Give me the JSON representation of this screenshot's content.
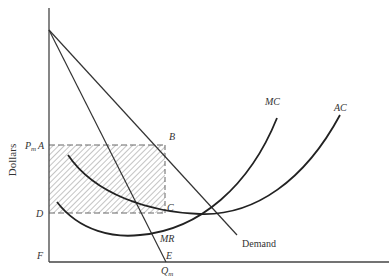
{
  "diagram": {
    "y_axis_label": "Dollars",
    "point_labels": {
      "pm": "P",
      "pm_sub": "m",
      "a": "A",
      "b": "B",
      "c": "C",
      "d": "D",
      "e": "E",
      "f": "F",
      "qm": "Q",
      "qm_sub": "m"
    },
    "curve_labels": {
      "mc": "MC",
      "ac": "AC",
      "mr": "MR",
      "demand": "Demand"
    },
    "colors": {
      "line": "#333333",
      "dash": "#666666",
      "hatch": "#888888",
      "background": "#ffffff"
    }
  }
}
